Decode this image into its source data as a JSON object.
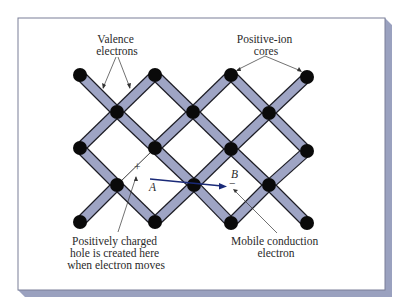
{
  "diagram": {
    "type": "crystal-lattice-semiconductor",
    "frame": {
      "x": 18,
      "y": 18,
      "w": 367,
      "h": 272,
      "border": "#7a7f98",
      "shadow": "#9aa1bf",
      "fill": "#ffffff"
    },
    "colors": {
      "bond_fill": "#9ea4c4",
      "bond_stroke": "#1c1c24",
      "node": "#0a0a0a",
      "arrow": "#1a2a78",
      "line": "#333333"
    },
    "nodes": [
      {
        "id": "n1",
        "x": 80,
        "y": 75
      },
      {
        "id": "n2",
        "x": 155,
        "y": 75
      },
      {
        "id": "n3",
        "x": 231,
        "y": 75
      },
      {
        "id": "n4",
        "x": 307,
        "y": 77
      },
      {
        "id": "n5",
        "x": 117,
        "y": 112
      },
      {
        "id": "n6",
        "x": 193,
        "y": 112
      },
      {
        "id": "n7",
        "x": 269,
        "y": 113
      },
      {
        "id": "n8",
        "x": 80,
        "y": 148
      },
      {
        "id": "n9",
        "x": 155,
        "y": 148
      },
      {
        "id": "n10",
        "x": 231,
        "y": 149
      },
      {
        "id": "n11",
        "x": 307,
        "y": 151
      },
      {
        "id": "n12",
        "x": 117,
        "y": 185
      },
      {
        "id": "n13",
        "x": 194,
        "y": 185
      },
      {
        "id": "n14",
        "x": 269,
        "y": 185
      },
      {
        "id": "n15",
        "x": 80,
        "y": 222
      },
      {
        "id": "n16",
        "x": 155,
        "y": 222
      },
      {
        "id": "n17",
        "x": 231,
        "y": 223
      },
      {
        "id": "n18",
        "x": 307,
        "y": 223
      }
    ],
    "bonds": [
      [
        "n1",
        "n5"
      ],
      [
        "n5",
        "n2"
      ],
      [
        "n2",
        "n6"
      ],
      [
        "n6",
        "n3"
      ],
      [
        "n3",
        "n7"
      ],
      [
        "n7",
        "n4"
      ],
      [
        "n5",
        "n8"
      ],
      [
        "n5",
        "n9"
      ],
      [
        "n6",
        "n9"
      ],
      [
        "n6",
        "n10"
      ],
      [
        "n7",
        "n10"
      ],
      [
        "n7",
        "n11"
      ],
      [
        "n8",
        "n12"
      ],
      [
        "n9",
        "n13"
      ],
      [
        "n10",
        "n13"
      ],
      [
        "n10",
        "n14"
      ],
      [
        "n11",
        "n14"
      ],
      [
        "n12",
        "n15"
      ],
      [
        "n12",
        "n16"
      ],
      [
        "n13",
        "n16"
      ],
      [
        "n13",
        "n17"
      ],
      [
        "n14",
        "n17"
      ],
      [
        "n14",
        "n18"
      ]
    ],
    "broken_bond": [
      "n9",
      "n12"
    ],
    "labels": {
      "valence": [
        "Valence",
        "electrons"
      ],
      "positive_ion": [
        "Positive-ion",
        "cores"
      ],
      "hole": [
        "Positively charged",
        "hole is created here",
        "when electron moves"
      ],
      "mobile": [
        "Mobile conduction",
        "electron"
      ],
      "point_a": "A",
      "point_b": "B",
      "plus": "+",
      "minus": "−"
    }
  }
}
